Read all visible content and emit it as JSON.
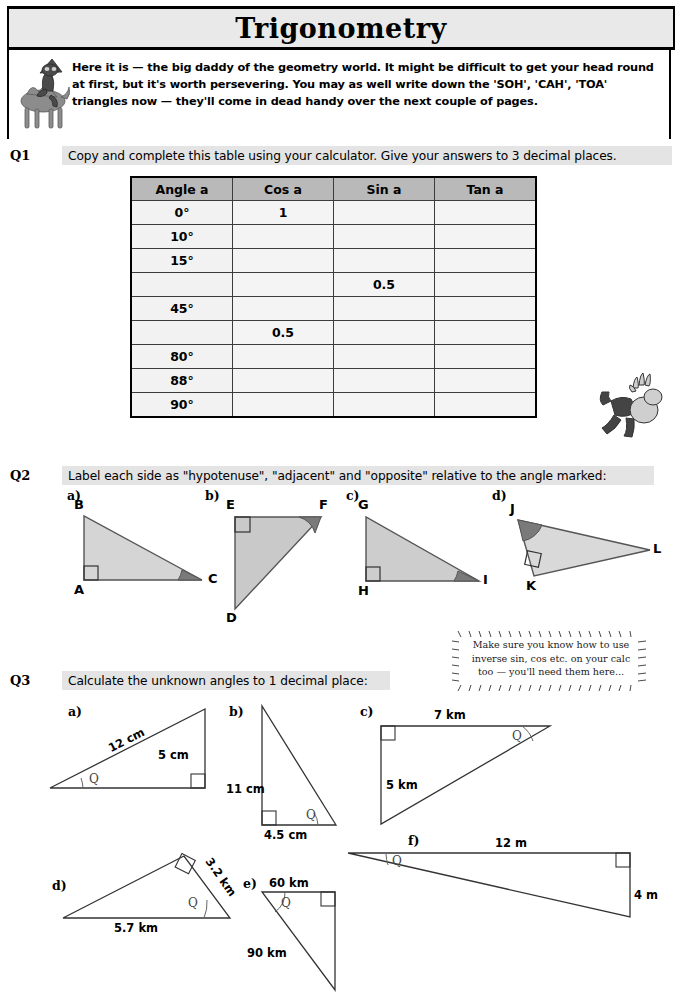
{
  "page": {
    "title": "Trigonometry",
    "intro": "Here it is — the big daddy of the geometry world.  It might be difficult to get your head round at first, but it's worth persevering.  You may as well write down the 'SOH', 'CAH', 'TOA' triangles now — they'll come in dead handy over the next couple of pages.",
    "mascot_left": "camel-rider-icon",
    "mascot_right": "tumbling-man-icon"
  },
  "q1": {
    "number": "Q1",
    "instruction": "Copy and complete this table using your calculator.  Give your answers to 3 decimal places.",
    "table": {
      "headers": [
        "Angle a",
        "Cos a",
        "Sin a",
        "Tan a"
      ],
      "rows": [
        [
          "0°",
          "1",
          "",
          ""
        ],
        [
          "10°",
          "",
          "",
          ""
        ],
        [
          "15°",
          "",
          "",
          ""
        ],
        [
          "",
          "",
          "0.5",
          ""
        ],
        [
          "45°",
          "",
          "",
          ""
        ],
        [
          "",
          "0.5",
          "",
          ""
        ],
        [
          "80°",
          "",
          "",
          ""
        ],
        [
          "88°",
          "",
          "",
          ""
        ],
        [
          "90°",
          "",
          "",
          ""
        ]
      ]
    }
  },
  "q2": {
    "number": "Q2",
    "instruction": "Label each side as \"hypotenuse\", \"adjacent\" and \"opposite\" relative to the angle marked:",
    "parts": [
      {
        "label": "a)",
        "vertices": [
          "B",
          "A",
          "C"
        ],
        "right_angle_at": "A",
        "marked_angle_at": "C"
      },
      {
        "label": "b)",
        "vertices": [
          "E",
          "F",
          "D"
        ],
        "right_angle_at": "E",
        "marked_angle_at": "F"
      },
      {
        "label": "c)",
        "vertices": [
          "G",
          "H",
          "I"
        ],
        "right_angle_at": "H",
        "marked_angle_at": "I"
      },
      {
        "label": "d)",
        "vertices": [
          "J",
          "K",
          "L"
        ],
        "right_angle_at": "K",
        "marked_angle_at": "J"
      }
    ]
  },
  "q3": {
    "number": "Q3",
    "instruction": "Calculate the unknown angles to 1 decimal place:",
    "note": "Make sure you know how to use inverse sin, cos etc. on your calc too — you'll need them here...",
    "angle_symbol": "Q",
    "parts": [
      {
        "label": "a)",
        "dims": [
          "12 cm",
          "5 cm"
        ]
      },
      {
        "label": "b)",
        "dims": [
          "11 cm",
          "4.5 cm"
        ]
      },
      {
        "label": "c)",
        "dims": [
          "7 km",
          "5 km"
        ]
      },
      {
        "label": "d)",
        "dims": [
          "3.2 km",
          "5.7 km"
        ]
      },
      {
        "label": "e)",
        "dims": [
          "60 km",
          "90 km"
        ]
      },
      {
        "label": "f)",
        "dims": [
          "12 m",
          "4 m"
        ]
      }
    ]
  },
  "colors": {
    "title_bar": "#e9e9e9",
    "strip": "#e4e4e4",
    "table_header": "#b9b9b9",
    "table_cell": "#f4f4f4",
    "tri_fill": "#cfcfcf",
    "tri_fill_light": "#dedede",
    "angle_mark": "#7a7a7a",
    "stroke": "#000000"
  }
}
